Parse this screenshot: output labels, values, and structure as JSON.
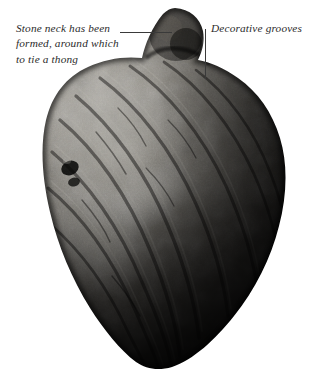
{
  "figure": {
    "background_color": "#ffffff",
    "subject_description": "Black and white photograph of a grooved stone anchor weight with a carved neck knob at the top",
    "annotation_text_color": "#2b2b2b",
    "leader_line_color": "#3a3a3a"
  },
  "annotations": [
    {
      "id": "neck",
      "lines": [
        "Stone neck has been",
        "formed, around which",
        "to tie a thong"
      ],
      "leader": "horizontal"
    },
    {
      "id": "grooves",
      "lines": [
        "Decorative grooves"
      ],
      "leader": "vertical"
    }
  ],
  "stone": {
    "body_tone_light": "#b9b6ae",
    "body_tone_mid": "#6e6a63",
    "body_tone_dark": "#1d1c1a",
    "shadow_tone": "#0a0a09"
  }
}
